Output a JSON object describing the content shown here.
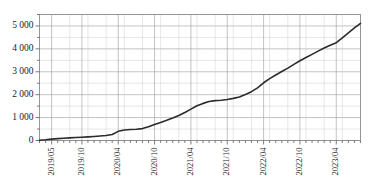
{
  "chart_data": {
    "type": "line",
    "title": "",
    "subtitle": "",
    "xlabel": "",
    "ylabel": "",
    "grid": true,
    "legend": "none",
    "ylim": [
      0,
      5500
    ],
    "ytick_labels": [
      "5 000",
      "4 000",
      "3 000",
      "2 000",
      "1 000",
      "0"
    ],
    "ytick_values": [
      5000,
      4000,
      3000,
      2000,
      1000,
      0
    ],
    "yminor_step": 500,
    "xtick_labels": [
      "2019/05",
      "2019/10",
      "2020/04",
      "2020/10",
      "2021/04",
      "2021/10",
      "2022/04",
      "2022/10",
      "2023/04"
    ],
    "xtick_values": [
      "2019-05",
      "2019-10",
      "2020-04",
      "2020-10",
      "2021-04",
      "2021-10",
      "2022-04",
      "2022-10",
      "2023-04"
    ],
    "xtick_rotation": 90,
    "xlim": [
      "2019-03",
      "2023-08"
    ],
    "series": [
      {
        "name": "cumulative-total",
        "color": "#2b2b2b",
        "x": [
          "2019-03",
          "2019-04",
          "2019-05",
          "2019-06",
          "2019-07",
          "2019-08",
          "2019-09",
          "2019-10",
          "2019-11",
          "2019-12",
          "2020-01",
          "2020-02",
          "2020-03",
          "2020-04",
          "2020-05",
          "2020-06",
          "2020-07",
          "2020-08",
          "2020-09",
          "2020-10",
          "2020-11",
          "2020-12",
          "2021-01",
          "2021-02",
          "2021-03",
          "2021-04",
          "2021-05",
          "2021-06",
          "2021-07",
          "2021-08",
          "2021-09",
          "2021-10",
          "2021-11",
          "2021-12",
          "2022-01",
          "2022-02",
          "2022-03",
          "2022-04",
          "2022-05",
          "2022-06",
          "2022-07",
          "2022-08",
          "2022-09",
          "2022-10",
          "2022-11",
          "2022-12",
          "2023-01",
          "2023-02",
          "2023-03",
          "2023-04",
          "2023-05",
          "2023-06",
          "2023-07",
          "2023-08"
        ],
        "values": [
          10,
          30,
          60,
          80,
          100,
          115,
          130,
          145,
          160,
          175,
          195,
          215,
          260,
          400,
          460,
          480,
          490,
          520,
          600,
          700,
          790,
          880,
          980,
          1090,
          1220,
          1370,
          1520,
          1620,
          1700,
          1740,
          1760,
          1790,
          1840,
          1900,
          2010,
          2130,
          2300,
          2520,
          2700,
          2860,
          3010,
          3160,
          3320,
          3480,
          3620,
          3760,
          3900,
          4040,
          4160,
          4270,
          4480,
          4700,
          4920,
          5110
        ]
      }
    ]
  },
  "axes": {
    "y_axis_name": "value-axis",
    "x_axis_name": "time-axis"
  },
  "caption": ""
}
